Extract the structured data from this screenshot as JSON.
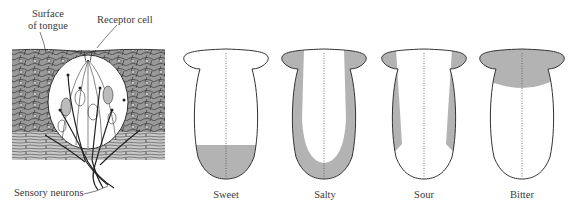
{
  "figure": {
    "taste_bud": {
      "labels": {
        "surface": [
          "Surface",
          "of tongue"
        ],
        "receptor": "Receptor cell",
        "neurons": "Sensory neurons"
      }
    },
    "tongues": [
      {
        "label": "Sweet",
        "region": "tip"
      },
      {
        "label": "Salty",
        "region": "sides-and-tip"
      },
      {
        "label": "Sour",
        "region": "sides"
      },
      {
        "label": "Bitter",
        "region": "back"
      }
    ],
    "colors": {
      "shade": "#b3b3b3",
      "outline": "#333333",
      "tissue": "#8c8c8c",
      "background": "#ffffff"
    }
  }
}
